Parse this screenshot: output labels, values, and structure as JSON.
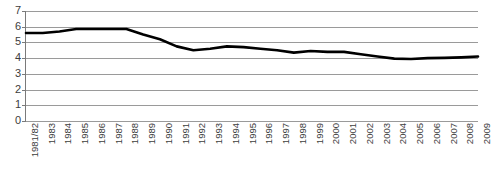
{
  "chart_data": {
    "type": "line",
    "title": "",
    "subtitle": "",
    "xlabel": "",
    "ylabel": "",
    "ylim": [
      0,
      7
    ],
    "ytick_labels": [
      "7",
      "6",
      "5",
      "4",
      "3",
      "2",
      "1",
      "0"
    ],
    "ytick_values": [
      7,
      6,
      5,
      4,
      3,
      2,
      1,
      0
    ],
    "grid": "horizontal",
    "legend": "none",
    "line_color": "#000000",
    "gridline_color": "#9a9a9a",
    "background_color": "#ffffff",
    "categories": [
      "1981/82",
      "1983",
      "1984",
      "1985",
      "1986",
      "1987",
      "1988",
      "1989",
      "1990",
      "1991",
      "1992",
      "1993",
      "1994",
      "1995",
      "1996",
      "1997",
      "1998",
      "1999",
      "2000",
      "2001",
      "2002",
      "2003",
      "2004",
      "2005",
      "2006",
      "2007",
      "2008",
      "2009"
    ],
    "series": [
      {
        "name": "series-1",
        "values": [
          5.6,
          5.6,
          5.7,
          5.85,
          5.85,
          5.85,
          5.85,
          5.5,
          5.2,
          4.75,
          4.5,
          4.6,
          4.75,
          4.7,
          4.6,
          4.5,
          4.35,
          4.45,
          4.4,
          4.4,
          4.25,
          4.1,
          3.97,
          3.95,
          4.0,
          4.02,
          4.05,
          4.1
        ]
      }
    ]
  }
}
